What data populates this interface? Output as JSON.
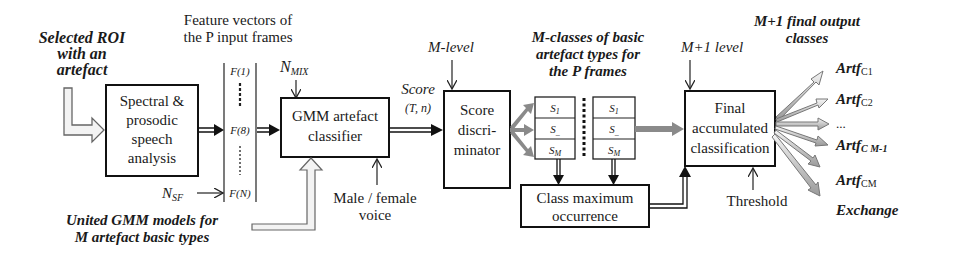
{
  "input": {
    "roi_label_lines": [
      "Selected ROI",
      "with an",
      "artefact"
    ],
    "models_label_lines": [
      "United GMM models for",
      "M artefact basic types"
    ]
  },
  "blocks": {
    "spectral": {
      "lines": [
        "Spectral &",
        "prosodic",
        "speech",
        "analysis"
      ]
    },
    "gmm": {
      "lines": [
        "GMM artefact",
        "classifier"
      ]
    },
    "score": {
      "lines": [
        "Score",
        "discri-",
        "minator"
      ]
    },
    "class_max": {
      "lines": [
        "Class maximum",
        "occurrence"
      ]
    },
    "final": {
      "lines": [
        "Final",
        "accumulated",
        "classification"
      ]
    }
  },
  "features": {
    "title_lines": [
      "Feature vectors of",
      "the P input frames"
    ],
    "items": [
      "F(1)",
      "F(8)",
      "F(N)"
    ],
    "nsf_label": "N",
    "nsf_sub": "SF"
  },
  "params": {
    "nmix_label": "N",
    "nmix_sub": "MIX",
    "voice_lines": [
      "Male / female",
      "voice"
    ],
    "score_label": "Score",
    "score_args": "(T, n)",
    "m_level": "M-level",
    "m1_level": "M+1 level",
    "threshold": "Threshold"
  },
  "classes": {
    "title_lines": [
      "M-classes of basic",
      "artefact types for",
      "the P frames"
    ],
    "stack_cells": [
      "S1",
      "S_",
      "SM"
    ]
  },
  "outputs": {
    "title_lines": [
      "M+1 final output",
      "classes"
    ],
    "items": [
      {
        "base": "Artf",
        "sub": "C1"
      },
      {
        "base": "Artf",
        "sub": "C2"
      },
      {
        "base": "...",
        "sub": ""
      },
      {
        "base": "Artf",
        "sub": "C M-1"
      },
      {
        "base": "Artf",
        "sub": "CM"
      },
      {
        "base": "Exchange",
        "sub": ""
      }
    ]
  },
  "colors": {
    "line": "#111111",
    "hollow_arrow_fill": "#eeeeee",
    "gray_arrow": "#8a8a8a"
  }
}
